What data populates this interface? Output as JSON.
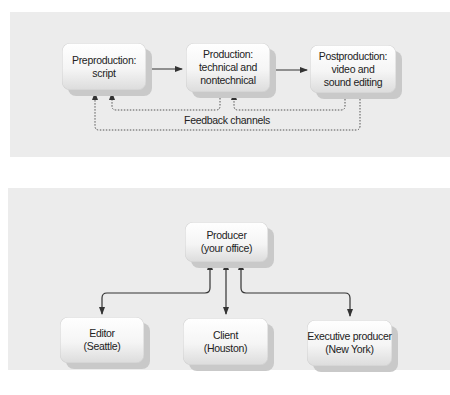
{
  "figures": [
    {
      "id": "production-process",
      "nodes": [
        {
          "id": "preproduction",
          "lines": [
            "Preproduction:",
            "script"
          ]
        },
        {
          "id": "production",
          "lines": [
            "Production:",
            "technical and",
            "nontechnical"
          ]
        },
        {
          "id": "postproduction",
          "lines": [
            "Postproduction:",
            "video and",
            "sound editing"
          ]
        }
      ],
      "feedback_label": "Feedback channels",
      "colors": {
        "panel": "#ececec",
        "arrow": "#333333"
      }
    },
    {
      "id": "communication-network",
      "nodes": [
        {
          "id": "producer",
          "lines": [
            "Producer",
            "(your office)"
          ]
        },
        {
          "id": "editor",
          "lines": [
            "Editor",
            "(Seattle)"
          ]
        },
        {
          "id": "client",
          "lines": [
            "Client",
            "(Houston)"
          ]
        },
        {
          "id": "executive-producer",
          "lines": [
            "Executive producer",
            "(New York)"
          ]
        }
      ]
    }
  ]
}
